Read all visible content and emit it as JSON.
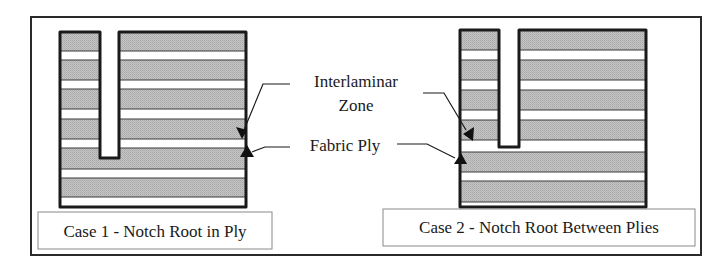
{
  "figure": {
    "labels": {
      "interlaminar_line1": "Interlaminar",
      "interlaminar_line2": "Zone",
      "fabric_ply": "Fabric Ply"
    },
    "cases": [
      {
        "id": "case1",
        "caption": "Case 1 - Notch Root in Ply",
        "notch_root_location": "in ply"
      },
      {
        "id": "case2",
        "caption": "Case 2 - Notch Root Between Plies",
        "notch_root_location": "between plies"
      }
    ],
    "colors": {
      "ply_fill": "#bdbdbd",
      "interlaminar_fill": "#ffffff",
      "outline": "#1a1a1a",
      "frame": "#2a2a2a",
      "caption_border": "#8a8a8a"
    }
  }
}
